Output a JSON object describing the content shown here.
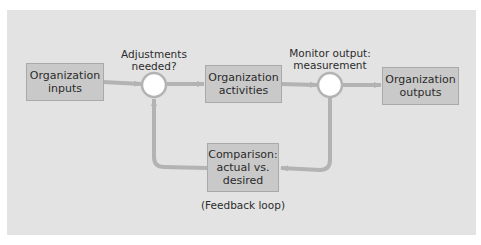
{
  "diagram": {
    "title": "",
    "colors": {
      "panel_background": "#e3e3e3",
      "box_fill": "#c9c9c9",
      "box_border": "#a9a9a9",
      "arrow": "#b3b3b3",
      "node_fill": "#ffffff",
      "text": "#2b2b2b"
    },
    "boxes": {
      "inputs": "Organization\ninputs",
      "activities": "Organization\nactivities",
      "outputs": "Organization\noutputs",
      "comparison": "Comparison:\nactual vs.\ndesired"
    },
    "nodes": {
      "adjustments": "Adjustments\nneeded?",
      "monitor": "Monitor output:\nmeasurement"
    },
    "feedback_label": "(Feedback loop)",
    "edges": [
      {
        "from": "inputs",
        "to": "adjustments"
      },
      {
        "from": "adjustments",
        "to": "activities"
      },
      {
        "from": "activities",
        "to": "monitor"
      },
      {
        "from": "monitor",
        "to": "outputs"
      },
      {
        "from": "monitor",
        "to": "comparison"
      },
      {
        "from": "comparison",
        "to": "adjustments"
      }
    ]
  }
}
